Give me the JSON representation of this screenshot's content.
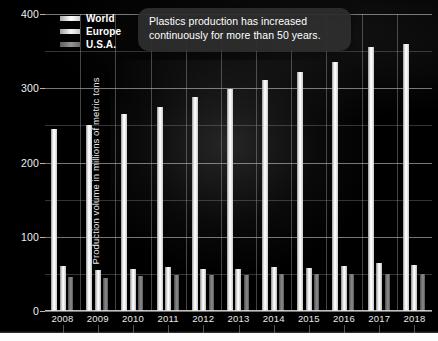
{
  "chart_data": {
    "type": "bar",
    "title": "",
    "annotation": "Plastics production has increased continuously for more than 50 years.",
    "xlabel": "",
    "ylabel": "Production volume in millions of metric tons",
    "categories": [
      "2008",
      "2009",
      "2010",
      "2011",
      "2012",
      "2013",
      "2014",
      "2015",
      "2016",
      "2017",
      "2018"
    ],
    "series": [
      {
        "name": "World",
        "values": [
          245,
          250,
          265,
          275,
          288,
          299,
          311,
          322,
          335,
          355,
          359
        ]
      },
      {
        "name": "Europe",
        "values": [
          60,
          55,
          57,
          59,
          57,
          57,
          59,
          58,
          60,
          64,
          62
        ]
      },
      {
        "name": "U.S.A.",
        "values": [
          46,
          44,
          47,
          48,
          48,
          49,
          50,
          50,
          50,
          50,
          50
        ]
      }
    ],
    "ylim": [
      0,
      400
    ],
    "yticks": [
      "0",
      "100",
      "200",
      "300",
      "400"
    ],
    "yticks_values": [
      0,
      100,
      200,
      300,
      400
    ],
    "minor_gridlines": [
      50,
      150,
      250,
      350
    ],
    "grid": true,
    "legend_position": "top-left",
    "colors": {
      "world": "#ffffff",
      "europe": "#f0f0f0",
      "usa": "#8c8c8c",
      "background": "#000000",
      "gridline": "#bebebe",
      "text": "#ffffff",
      "callout_background": "#2e2e2e"
    }
  },
  "legend": {
    "items": [
      {
        "label": "World",
        "key": "world"
      },
      {
        "label": "Europe",
        "key": "europe"
      },
      {
        "label": "U.S.A.",
        "key": "usa"
      }
    ]
  }
}
